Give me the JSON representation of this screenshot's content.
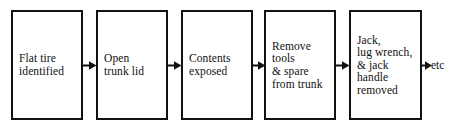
{
  "diagram": {
    "type": "flowchart",
    "orientation": "left-to-right",
    "title": "",
    "box_border_color": "#111111",
    "box_fill_color": "#ffffff",
    "arrow_color": "#111111",
    "background_color": "#ffffff",
    "steps": [
      {
        "id": "step-1",
        "label": "Flat tire\nidentified",
        "lines": [
          "Flat tire",
          "identified"
        ],
        "x": 11,
        "y": 10,
        "width": 72,
        "height": 110
      },
      {
        "id": "step-2",
        "label": "Open\ntrunk lid",
        "lines": [
          "Open",
          "trunk lid"
        ],
        "x": 96,
        "y": 10,
        "width": 72,
        "height": 110
      },
      {
        "id": "step-3",
        "label": "Contents\nexposed",
        "lines": [
          "Contents",
          "exposed"
        ],
        "x": 181,
        "y": 10,
        "width": 72,
        "height": 110
      },
      {
        "id": "step-4",
        "label": "Remove\ntools\n& spare\nfrom trunk",
        "lines": [
          "Remove",
          "tools",
          "& spare",
          "from trunk"
        ],
        "x": 264,
        "y": 10,
        "width": 72,
        "height": 110
      },
      {
        "id": "step-5",
        "label": "Jack,\nlug wrench,\n& jack\nhandle\nremoved",
        "lines": [
          "Jack,",
          "lug wrench,",
          "& jack",
          "handle",
          "removed"
        ],
        "x": 349,
        "y": 10,
        "width": 73,
        "height": 110
      }
    ],
    "connectors": [
      {
        "id": "arrow-1",
        "from": "step-1",
        "to": "step-2",
        "x": 82,
        "y": 60
      },
      {
        "id": "arrow-2",
        "from": "step-2",
        "to": "step-3",
        "x": 167,
        "y": 60
      },
      {
        "id": "arrow-3",
        "from": "step-3",
        "to": "step-4",
        "x": 251,
        "y": 60
      },
      {
        "id": "arrow-4",
        "from": "step-4",
        "to": "step-5",
        "x": 335,
        "y": 60
      },
      {
        "id": "arrow-5",
        "from": "step-5",
        "to": "etc",
        "x": 421,
        "y": 60
      }
    ],
    "continuation": {
      "id": "etc",
      "label": "etc",
      "x": 431,
      "y": 59
    }
  }
}
